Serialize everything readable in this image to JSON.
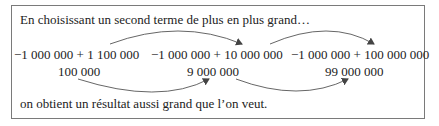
{
  "intro": "En choisissant un second terme de plus en plus grand…",
  "sums": [
    {
      "expr": "−1 000 000 + 1 100 000",
      "result": "100 000"
    },
    {
      "expr": "−1 000 000 + 10 000 000",
      "result": "9 000 000"
    },
    {
      "expr": "−1 000 000 + 100 000 000",
      "result": "99 000 000"
    }
  ],
  "conclusion": "on obtient un résultat aussi grand que l’on veut.",
  "colors": {
    "border": "#7a7a7a",
    "text": "#222222",
    "arrow": "#444444"
  }
}
